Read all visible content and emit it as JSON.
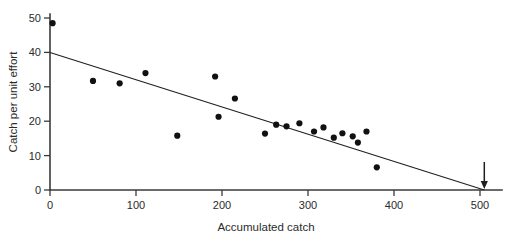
{
  "chart_data": {
    "type": "scatter",
    "title": "",
    "subtitle": "",
    "xlabel": "Accumulated catch",
    "ylabel": "Catch per unit effort",
    "xlim": [
      0,
      520
    ],
    "ylim": [
      0,
      50
    ],
    "xticks": [
      0,
      100,
      200,
      300,
      400,
      500
    ],
    "xticklabels": [
      "0",
      "100",
      "200",
      "300",
      "400",
      "500"
    ],
    "yticks": [
      0,
      10,
      20,
      30,
      40,
      50
    ],
    "yticklabels": [
      "0",
      "10",
      "20",
      "30",
      "40",
      "50"
    ],
    "grid": false,
    "legend": null,
    "series": [
      {
        "name": "Catch per unit effort observations",
        "type": "scatter",
        "marker": "filled-circle",
        "color": "#111111",
        "points": [
          [
            3,
            48.5
          ],
          [
            50,
            31.7
          ],
          [
            81,
            31.0
          ],
          [
            111,
            34.0
          ],
          [
            148,
            15.8
          ],
          [
            192,
            33.0
          ],
          [
            196,
            21.3
          ],
          [
            215,
            26.6
          ],
          [
            250,
            16.4
          ],
          [
            263,
            19.0
          ],
          [
            275,
            18.5
          ],
          [
            290,
            19.4
          ],
          [
            307,
            17.0
          ],
          [
            318,
            18.2
          ],
          [
            330,
            15.2
          ],
          [
            340,
            16.5
          ],
          [
            352,
            15.6
          ],
          [
            358,
            13.8
          ],
          [
            368,
            17.0
          ],
          [
            380,
            6.6
          ]
        ]
      },
      {
        "name": "Linear regression fit",
        "type": "line",
        "color": "#1f1f1f",
        "endpoints": [
          [
            0,
            40
          ],
          [
            505,
            0
          ]
        ],
        "intercept": 40,
        "slope": -0.0792,
        "x_intercept": 505
      }
    ],
    "annotations": [
      {
        "name": "x-intercept-arrow",
        "shape": "down-arrow",
        "x": 505,
        "y": 0,
        "label": ""
      }
    ],
    "axis_colors": {
      "axis": "#3a3a3a",
      "text": "#2b2b2b",
      "point": "#111111",
      "fit": "#1f1f1f",
      "background": "#ffffff"
    }
  }
}
